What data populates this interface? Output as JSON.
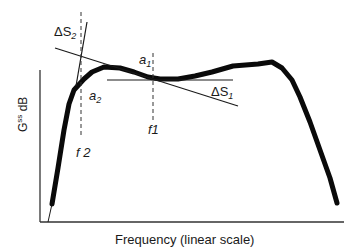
{
  "figure": {
    "x_axis_label": "Frequency (linear scale)",
    "y_axis_label_main": "G",
    "y_axis_label_sup": "ss",
    "y_axis_label_unit": " dB",
    "labels": {
      "delta_s2": "ΔS",
      "delta_s2_sub": "2",
      "delta_s1": "ΔS",
      "delta_s1_sub": "1",
      "a1": "a",
      "a1_sub": "1",
      "a2": "a",
      "a2_sub": "2",
      "f1": "f1",
      "f2": "f 2"
    },
    "colors": {
      "curve": "#0a0a0a",
      "axes": "#333333",
      "lines": "#1a1a1a",
      "dashed": "#333333"
    }
  }
}
